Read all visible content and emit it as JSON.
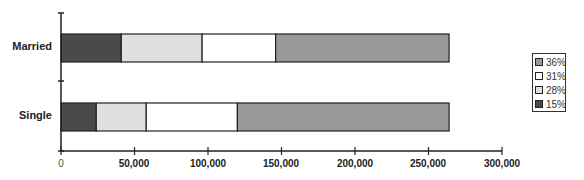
{
  "chart_data": {
    "type": "bar",
    "orientation": "horizontal",
    "stacked": true,
    "title": "",
    "xlabel": "",
    "ylabel": "",
    "categories": [
      "Married",
      "Single"
    ],
    "series": [
      {
        "name": "15%",
        "color": "#4a4a4a",
        "values": [
          41000,
          24000
        ]
      },
      {
        "name": "28%",
        "color": "#e0e0e0",
        "values": [
          55000,
          34000
        ]
      },
      {
        "name": "31%",
        "color": "#ffffff",
        "values": [
          50000,
          62000
        ]
      },
      {
        "name": "36%",
        "color": "#999999",
        "values": [
          118000,
          144000
        ]
      }
    ],
    "xlim": [
      0,
      300000
    ],
    "x_ticks": [
      "0",
      "50,000",
      "100,000",
      "150,000",
      "200,000",
      "250,000",
      "300,000"
    ],
    "grid": false,
    "legend": {
      "position": "right",
      "entries": [
        "36%",
        "31%",
        "28%",
        "15%"
      ]
    }
  }
}
